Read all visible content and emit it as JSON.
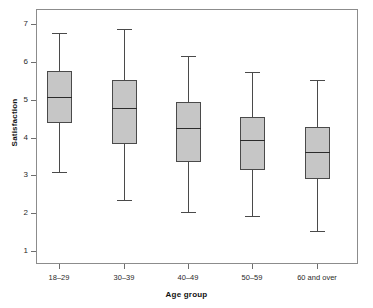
{
  "chart_data": {
    "type": "box",
    "title": "",
    "xlabel": "Age group",
    "ylabel": "Satisfaction",
    "categories": [
      "18–29",
      "30–39",
      "40–49",
      "50–59",
      "60 and over"
    ],
    "yticks": [
      1,
      2,
      3,
      4,
      5,
      6,
      7
    ],
    "ytick_labels": [
      "1",
      "2",
      "3",
      "4",
      "5",
      "6",
      "7"
    ],
    "ylim": [
      0.65,
      7.3
    ],
    "grid": false,
    "legend": null,
    "box_fill_color": "#c6c6c6",
    "box_line_color": "#4a4a4a",
    "boxes": [
      {
        "category": "18–29",
        "whisker_low": 3.08,
        "q1": 4.38,
        "median": 5.07,
        "q3": 5.76,
        "whisker_high": 6.76
      },
      {
        "category": "30–39",
        "whisker_low": 2.35,
        "q1": 3.82,
        "median": 4.77,
        "q3": 5.52,
        "whisker_high": 6.88
      },
      {
        "category": "40–49",
        "whisker_low": 2.04,
        "q1": 3.34,
        "median": 4.25,
        "q3": 4.94,
        "whisker_high": 6.15
      },
      {
        "category": "50–59",
        "whisker_low": 1.92,
        "q1": 3.13,
        "median": 3.94,
        "q3": 4.54,
        "whisker_high": 5.73
      },
      {
        "category": "60 and over",
        "whisker_low": 1.52,
        "q1": 2.9,
        "median": 3.61,
        "q3": 4.27,
        "whisker_high": 5.52
      }
    ]
  },
  "axis": {
    "y_title": "Satisfaction",
    "x_title": "Age group"
  }
}
